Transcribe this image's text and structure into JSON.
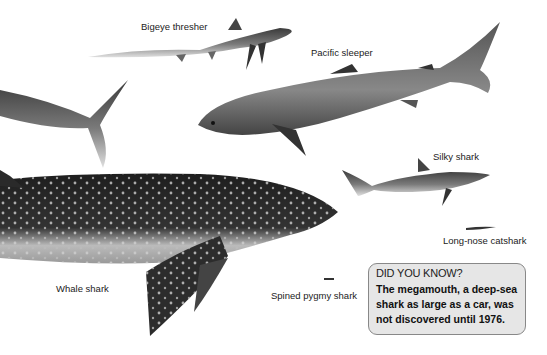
{
  "labels": {
    "bigeye_thresher": "Bigeye thresher",
    "pacific_sleeper": "Pacific sleeper",
    "silky_shark": "Silky shark",
    "long_nose_catshark": "Long-nose catshark",
    "whale_shark": "Whale shark",
    "spined_pygmy_shark": "Spined pygmy shark"
  },
  "did_you_know": {
    "title": "DID YOU KNOW?",
    "body": "The megamouth, a deep-sea shark as large as a car, was not discovered until 1976."
  },
  "colors": {
    "background": "#ffffff",
    "box_fill": "#e6e6e6",
    "box_border": "#888888",
    "shark_dark": "#2a2a2a",
    "shark_light": "#d8d8d8"
  }
}
